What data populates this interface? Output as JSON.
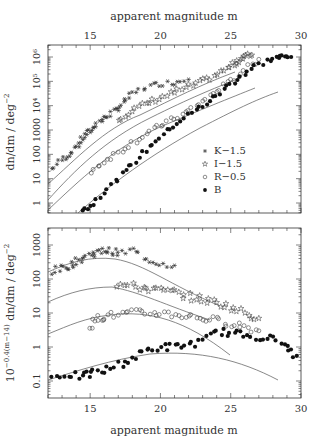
{
  "figure": {
    "top_xlabel": "apparent magnitude m",
    "bottom_xlabel": "apparent magnitude m",
    "top_ylabel": "dn/dm  /  deg",
    "top_ylabel_sup": "−2",
    "bottom_ylabel": "10",
    "bottom_ylabel_sup": "−0.4(m−14)",
    "bottom_ylabel_rest": " dn/dm  /  deg",
    "bottom_ylabel_sup2": "−2",
    "legend": [
      {
        "marker": "asterisk",
        "label": "K−1.5"
      },
      {
        "marker": "star",
        "label": "I−1.5"
      },
      {
        "marker": "circle",
        "label": "R−0.5"
      },
      {
        "marker": "filled-circle",
        "label": "B"
      }
    ],
    "x_ticks": [
      "15",
      "20",
      "25",
      "30"
    ],
    "top_y_ticks": [
      "1",
      "10",
      "100",
      "1000",
      "10⁴",
      "10⁵",
      "10⁶"
    ],
    "bottom_y_ticks": [
      "0.1",
      "1",
      "10",
      "100",
      "1000"
    ]
  },
  "chart_data": [
    {
      "type": "scatter",
      "title": "Galaxy number counts",
      "xlabel": "apparent magnitude m",
      "ylabel": "dn/dm / deg^-2",
      "xlim": [
        12,
        30
      ],
      "ylim": [
        0.5,
        2000000
      ],
      "yscale": "log",
      "x_ticks": [
        15,
        20,
        25,
        30
      ],
      "y_ticks": [
        1,
        10,
        100,
        1000,
        10000,
        100000,
        1000000
      ],
      "legend_position": "lower right",
      "series": [
        {
          "name": "K−1.5",
          "marker": "asterisk",
          "x": [
            12.3,
            13.0,
            13.5,
            14.0,
            14.4,
            14.8,
            15.1,
            15.5,
            16.0,
            16.5,
            17.0,
            17.5,
            18.0,
            19.0,
            20.0,
            21.0,
            22.0
          ],
          "y": [
            25,
            60,
            100,
            200,
            400,
            700,
            1000,
            2000,
            3000,
            5000,
            8000,
            15000,
            30000,
            60000,
            80000,
            90000,
            120000
          ]
        },
        {
          "name": "I−1.5",
          "marker": "star",
          "x": [
            17.0,
            18.0,
            19.0,
            20.0,
            21.0,
            22.0,
            23.0,
            24.0,
            25.0,
            25.5,
            26.0,
            26.5
          ],
          "y": [
            3000,
            6000,
            12000,
            20000,
            35000,
            60000,
            100000,
            200000,
            400000,
            700000,
            1000000,
            1200000
          ]
        },
        {
          "name": "R−0.5",
          "marker": "circle",
          "x": [
            15.0,
            16.0,
            17.0,
            18.0,
            19.0,
            20.0,
            21.0,
            22.0,
            23.0,
            24.0,
            25.0,
            26.0,
            27.0
          ],
          "y": [
            20,
            50,
            120,
            300,
            700,
            1500,
            3000,
            6000,
            15000,
            40000,
            100000,
            300000,
            800000
          ]
        },
        {
          "name": "B",
          "marker": "filled-circle",
          "x": [
            14.3,
            15.0,
            16.0,
            17.0,
            18.0,
            19.0,
            20.0,
            21.0,
            22.0,
            23.0,
            24.0,
            25.0,
            26.0,
            27.0,
            28.0,
            28.7,
            29.3
          ],
          "y": [
            0.5,
            0.7,
            3,
            10,
            40,
            150,
            500,
            1500,
            4000,
            10000,
            25000,
            80000,
            200000,
            500000,
            900000,
            1000000,
            1000000
          ]
        }
      ],
      "model_curves": 4
    },
    {
      "type": "scatter",
      "xlabel": "apparent magnitude m",
      "ylabel": "10^{-0.4(m-14)} dn/dm / deg^-2",
      "xlim": [
        12,
        30
      ],
      "ylim": [
        0.03,
        2500
      ],
      "yscale": "log",
      "x_ticks": [
        15,
        20,
        25,
        30
      ],
      "y_ticks": [
        0.1,
        1,
        10,
        100,
        1000
      ],
      "series": [
        {
          "name": "K−1.5",
          "marker": "asterisk",
          "x": [
            12.3,
            13.0,
            13.5,
            14.0,
            14.5,
            15.0,
            15.5,
            16.0,
            16.5,
            17.0,
            18.0,
            19.0,
            20.0,
            21.0
          ],
          "y": [
            170,
            200,
            250,
            320,
            400,
            550,
            600,
            700,
            650,
            550,
            700,
            400,
            300,
            250
          ]
        },
        {
          "name": "I−1.5",
          "marker": "star",
          "x": [
            17.0,
            18.0,
            19.0,
            20.0,
            21.0,
            22.0,
            23.0,
            24.0,
            25.0,
            26.0,
            27.0
          ],
          "y": [
            70,
            60,
            55,
            45,
            40,
            30,
            25,
            20,
            15,
            10,
            7
          ]
        },
        {
          "name": "R−0.5",
          "marker": "circle",
          "x": [
            15.0,
            15.5,
            16.0,
            17.0,
            18.0,
            19.0,
            20.0,
            21.0,
            22.0,
            23.0,
            24.0,
            25.0,
            26.0,
            27.0
          ],
          "y": [
            4,
            7,
            8,
            9,
            10,
            10,
            10,
            9,
            8,
            7,
            6,
            5,
            4,
            3
          ]
        },
        {
          "name": "B",
          "marker": "filled-circle",
          "x": [
            12.3,
            13.5,
            14.5,
            15.0,
            16.0,
            17.0,
            18.0,
            19.0,
            20.0,
            21.0,
            22.0,
            23.0,
            24.0,
            25.0,
            26.0,
            27.0,
            28.0,
            29.0,
            29.7
          ],
          "y": [
            0.13,
            0.16,
            0.13,
            0.17,
            0.2,
            0.3,
            0.45,
            0.8,
            1.0,
            1.0,
            1.2,
            1.4,
            3,
            2.5,
            2.3,
            2.0,
            1.7,
            1.0,
            0.55
          ]
        }
      ],
      "model_curves": 4
    }
  ]
}
